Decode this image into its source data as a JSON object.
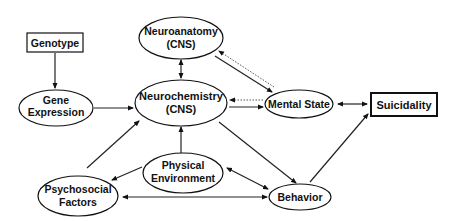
{
  "diagram": {
    "nodes": [
      {
        "id": "genotype",
        "shape": "rect",
        "lines": [
          "Genotype"
        ]
      },
      {
        "id": "gene_expression",
        "shape": "ellipse",
        "lines": [
          "Gene",
          "Expression"
        ]
      },
      {
        "id": "neuroanatomy",
        "shape": "ellipse",
        "lines": [
          "Neuroanatomy",
          "(CNS)"
        ]
      },
      {
        "id": "neurochemistry",
        "shape": "ellipse",
        "lines": [
          "Neurochemistry",
          "(CNS)"
        ]
      },
      {
        "id": "mental_state",
        "shape": "ellipse",
        "lines": [
          "Mental State"
        ]
      },
      {
        "id": "suicidality",
        "shape": "rect-thick",
        "lines": [
          "Suicidality"
        ]
      },
      {
        "id": "physical_environment",
        "shape": "ellipse",
        "lines": [
          "Physical",
          "Environment"
        ]
      },
      {
        "id": "psychosocial_factors",
        "shape": "ellipse",
        "lines": [
          "Psychosocial",
          "Factors"
        ]
      },
      {
        "id": "behavior",
        "shape": "ellipse",
        "lines": [
          "Behavior"
        ]
      }
    ],
    "edges": [
      {
        "from": "genotype",
        "to": "gene_expression",
        "style": "solid",
        "direction": "forward"
      },
      {
        "from": "gene_expression",
        "to": "neurochemistry",
        "style": "solid",
        "direction": "forward"
      },
      {
        "from": "neuroanatomy",
        "to": "neurochemistry",
        "style": "solid",
        "direction": "both"
      },
      {
        "from": "neuroanatomy",
        "to": "mental_state",
        "style": "solid",
        "direction": "forward"
      },
      {
        "from": "mental_state",
        "to": "neuroanatomy",
        "style": "dotted",
        "direction": "forward"
      },
      {
        "from": "mental_state",
        "to": "neurochemistry",
        "style": "dotted",
        "direction": "forward"
      },
      {
        "from": "neurochemistry",
        "to": "mental_state",
        "style": "solid",
        "direction": "forward"
      },
      {
        "from": "mental_state",
        "to": "suicidality",
        "style": "solid",
        "direction": "both"
      },
      {
        "from": "psychosocial_factors",
        "to": "neurochemistry",
        "style": "solid",
        "direction": "forward"
      },
      {
        "from": "physical_environment",
        "to": "neurochemistry",
        "style": "solid",
        "direction": "forward"
      },
      {
        "from": "physical_environment",
        "to": "psychosocial_factors",
        "style": "solid",
        "direction": "forward"
      },
      {
        "from": "neurochemistry",
        "to": "behavior",
        "style": "solid",
        "direction": "forward"
      },
      {
        "from": "physical_environment",
        "to": "behavior",
        "style": "solid",
        "direction": "both"
      },
      {
        "from": "psychosocial_factors",
        "to": "behavior",
        "style": "solid",
        "direction": "both"
      },
      {
        "from": "behavior",
        "to": "suicidality",
        "style": "solid",
        "direction": "forward"
      }
    ]
  }
}
